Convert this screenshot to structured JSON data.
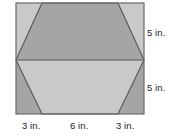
{
  "figure": {
    "shape_outer": "rectangle",
    "shape_inner": "hexagon",
    "colors": {
      "background": "#ffffff",
      "fill_dark": "#a5a5a5",
      "fill_light": "#c9c9c9",
      "stroke": "#585858",
      "label_text": "#1a1a1a"
    },
    "labels": {
      "right_top": "5 in.",
      "right_bottom": "5 in.",
      "bottom_left": "3 in.",
      "bottom_middle": "6 in.",
      "bottom_right": "3 in."
    },
    "geometry": {
      "rect": {
        "x": 16,
        "y": 3,
        "width": 128,
        "height": 111
      },
      "midline_y": 60,
      "hexagon_points": "42,3 118,3 144,60 118,114 42,114 16,60",
      "upper_trapezoid_points": "42,3 118,3 144,60 16,60",
      "lower_trapezoid_points": "16,60 144,60 118,114 42,114",
      "corner_top_left_points": "16,3 42,3 16,60",
      "corner_top_right_points": "118,3 144,3 144,60",
      "corner_bottom_left_points": "16,60 42,114 16,114",
      "corner_bottom_right_points": "144,60 144,114 118,114"
    },
    "measurements": {
      "height_upper_in": 5,
      "height_lower_in": 5,
      "base_left_in": 3,
      "base_middle_in": 6,
      "base_right_in": 3
    }
  }
}
